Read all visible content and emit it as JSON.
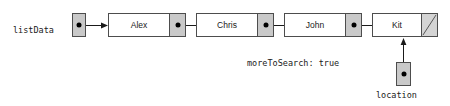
{
  "diagram": {
    "type": "linked-list",
    "title": "",
    "head_pointer": {
      "label": "listData",
      "target": "Alex"
    },
    "nodes": [
      {
        "value": "Alex",
        "next": "Chris"
      },
      {
        "value": "Chris",
        "next": "John"
      },
      {
        "value": "John",
        "next": "Kit"
      },
      {
        "value": "Kit",
        "next": null
      }
    ],
    "pointers": [
      {
        "label": "location",
        "target": "Kit",
        "direction": "up"
      }
    ],
    "annotations": [
      {
        "text": "moreToSearch: true"
      }
    ],
    "colors": {
      "pointer_cell_fill": "#c9c9c9",
      "node_fill": "#ffffff",
      "stroke": "#4d4d4d",
      "text": "#1a1a1a",
      "dot": "#000000"
    }
  }
}
